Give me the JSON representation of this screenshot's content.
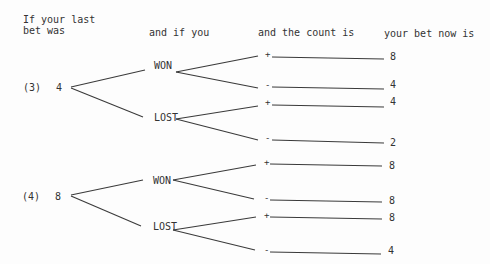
{
  "headers": {
    "last_bet_line1": "If your last",
    "last_bet_line2": "bet was",
    "if_you": "and if you",
    "count": "and the count is",
    "bet_now": "your bet now is"
  },
  "trees": [
    {
      "label": "(3)",
      "last_bet": "4",
      "outcomes": [
        {
          "result": "WON",
          "branches": [
            {
              "count": "+",
              "bet": "8"
            },
            {
              "count": "-",
              "bet": "4"
            }
          ]
        },
        {
          "result": "LOST",
          "branches": [
            {
              "count": "+",
              "bet": "4"
            },
            {
              "count": "-",
              "bet": "2"
            }
          ]
        }
      ]
    },
    {
      "label": "(4)",
      "last_bet": "8",
      "outcomes": [
        {
          "result": "WON",
          "branches": [
            {
              "count": "+",
              "bet": "8"
            },
            {
              "count": "-",
              "bet": "8"
            }
          ]
        },
        {
          "result": "LOST",
          "branches": [
            {
              "count": "+",
              "bet": "8"
            },
            {
              "count": "-",
              "bet": "4"
            }
          ]
        }
      ]
    }
  ]
}
